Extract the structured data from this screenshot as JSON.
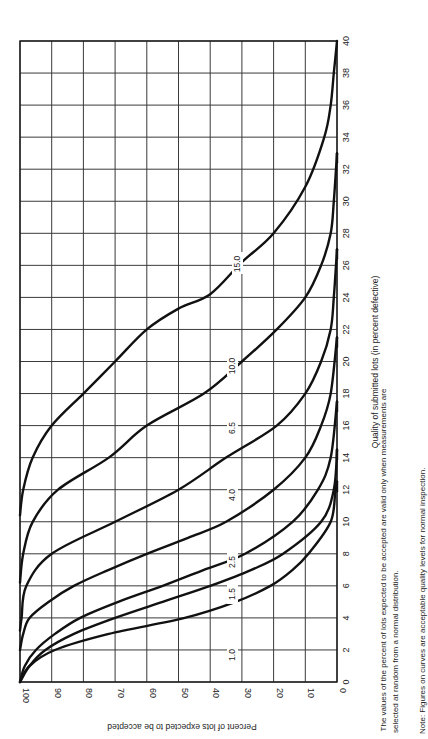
{
  "chart_data": {
    "type": "line",
    "orientation": "rotated-90-ccw",
    "title": "",
    "xlabel": "Quality of submitted lots (in percent defective)",
    "ylabel": "Percent of lots expected to be accepted",
    "xlim": [
      0,
      40
    ],
    "ylim": [
      0,
      100
    ],
    "x_ticks": [
      0,
      2,
      4,
      6,
      8,
      10,
      12,
      14,
      16,
      18,
      20,
      22,
      24,
      26,
      28,
      30,
      32,
      34,
      36,
      38,
      40
    ],
    "y_ticks": [
      100,
      90,
      80,
      70,
      60,
      50,
      40,
      30,
      20,
      10,
      0
    ],
    "grid": true,
    "legend": "curves labelled inline with AQL values",
    "series": [
      {
        "name": "1.0",
        "points": [
          [
            0,
            100
          ],
          [
            1,
            97
          ],
          [
            2,
            89
          ],
          [
            3,
            72
          ],
          [
            4,
            48
          ],
          [
            5,
            32
          ],
          [
            6,
            21
          ],
          [
            7,
            14
          ],
          [
            8,
            9
          ],
          [
            10,
            2
          ],
          [
            12,
            0.5
          ],
          [
            12.5,
            0
          ]
        ]
      },
      {
        "name": "1.5",
        "points": [
          [
            0,
            100
          ],
          [
            1,
            97
          ],
          [
            2,
            92
          ],
          [
            3,
            83
          ],
          [
            4,
            70
          ],
          [
            5,
            55
          ],
          [
            6,
            40
          ],
          [
            7,
            27
          ],
          [
            8,
            17
          ],
          [
            10,
            5
          ],
          [
            12,
            1
          ],
          [
            14.5,
            0
          ]
        ]
      },
      {
        "name": "2.5",
        "points": [
          [
            0,
            100
          ],
          [
            1,
            98.5
          ],
          [
            2,
            95
          ],
          [
            3,
            89
          ],
          [
            4,
            81
          ],
          [
            5,
            69
          ],
          [
            6,
            55
          ],
          [
            7,
            42
          ],
          [
            8,
            29
          ],
          [
            10,
            14
          ],
          [
            12,
            6
          ],
          [
            14,
            2
          ],
          [
            17.5,
            0
          ]
        ]
      },
      {
        "name": "4.0",
        "points": [
          [
            2,
            100
          ],
          [
            3,
            99
          ],
          [
            4,
            97
          ],
          [
            5,
            91
          ],
          [
            6,
            83
          ],
          [
            7,
            72
          ],
          [
            8,
            60
          ],
          [
            9,
            47
          ],
          [
            10,
            35
          ],
          [
            12,
            20
          ],
          [
            14,
            10
          ],
          [
            16,
            5
          ],
          [
            18,
            2
          ],
          [
            21.5,
            0
          ]
        ]
      },
      {
        "name": "6.5",
        "points": [
          [
            3.2,
            100
          ],
          [
            4,
            99.5
          ],
          [
            6,
            98
          ],
          [
            8,
            90
          ],
          [
            10,
            70
          ],
          [
            12,
            50
          ],
          [
            14,
            35
          ],
          [
            16,
            19
          ],
          [
            18,
            10
          ],
          [
            20,
            5
          ],
          [
            22,
            2
          ],
          [
            24,
            1
          ],
          [
            27,
            0
          ]
        ]
      },
      {
        "name": "10.0",
        "points": [
          [
            6.2,
            100
          ],
          [
            8,
            99
          ],
          [
            10,
            96
          ],
          [
            12,
            88
          ],
          [
            14,
            72
          ],
          [
            16,
            60
          ],
          [
            18,
            42
          ],
          [
            20,
            30
          ],
          [
            22,
            19
          ],
          [
            24,
            10
          ],
          [
            26,
            5
          ],
          [
            28,
            2
          ],
          [
            30,
            1
          ],
          [
            33,
            0
          ]
        ]
      },
      {
        "name": "15.0",
        "points": [
          [
            10.4,
            100
          ],
          [
            12,
            99
          ],
          [
            14,
            96
          ],
          [
            16,
            90
          ],
          [
            18,
            80
          ],
          [
            20,
            70
          ],
          [
            22,
            60
          ],
          [
            23.3,
            50
          ],
          [
            24.2,
            40
          ],
          [
            26.2,
            30
          ],
          [
            28,
            20
          ],
          [
            30.9,
            10
          ],
          [
            34,
            4
          ],
          [
            36,
            2
          ],
          [
            38,
            1
          ],
          [
            40,
            0
          ]
        ]
      }
    ]
  },
  "axes": {
    "x_tick_labels": [
      "0",
      "2",
      "4",
      "6",
      "8",
      "10",
      "12",
      "14",
      "16",
      "18",
      "20",
      "22",
      "24",
      "26",
      "28",
      "30",
      "32",
      "34",
      "36",
      "38",
      "40"
    ],
    "y_tick_labels": [
      "100",
      "90",
      "80",
      "70",
      "60",
      "50",
      "40",
      "30",
      "20",
      "10",
      "0"
    ],
    "xlabel": "Quality of submitted lots (in percent defective)",
    "ylabel": "Percent of lots expected to be accepted"
  },
  "curve_labels": [
    "1.0",
    "1.5",
    "2.5",
    "4.0",
    "6.5",
    "10.0",
    "15.0"
  ],
  "notes": {
    "validity_line1": "The values of the percent of lots expected to be accepted are valid only when measurements are",
    "validity_line2": "selected at random from a normal distribution.",
    "aql_note": "Note:  Figures on curves are acceptable quality levels for normal inspection."
  }
}
